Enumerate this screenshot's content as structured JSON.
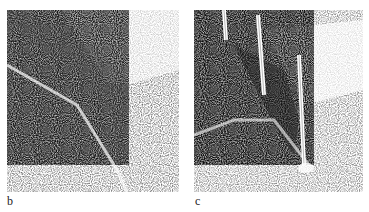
{
  "figure": {
    "panels": [
      {
        "label": "b",
        "description": "stippled illustration of a V-shaped groove/cut in textured surface, dark shaded face"
      },
      {
        "label": "c",
        "description": "stippled illustration of a deep V-shaped cut with three vertical pins/stakes inserted"
      }
    ],
    "colors": {
      "ink": "#1a1a1a",
      "paper": "#ffffff"
    }
  }
}
